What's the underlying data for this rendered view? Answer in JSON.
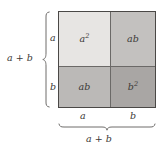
{
  "figure": {
    "quadrants": [
      {
        "name": "top-left",
        "label": "a",
        "exponent": "2",
        "fill": "#e7e5e3"
      },
      {
        "name": "top-right",
        "label": "ab",
        "exponent": "",
        "fill": "#c3c1bf"
      },
      {
        "name": "bottom-left",
        "label": "ab",
        "exponent": "",
        "fill": "#bbb9b7"
      },
      {
        "name": "bottom-right",
        "label": "b",
        "exponent": "2",
        "fill": "#a9a6a4"
      }
    ],
    "left_side": {
      "total_label": "a + b",
      "segment_top_label": "a",
      "segment_bottom_label": "b"
    },
    "bottom_side": {
      "total_label": "a + b",
      "segment_left_label": "a",
      "segment_right_label": "b"
    },
    "colors": {
      "border": "#4a4846",
      "divider": "#6b6967",
      "brace": "#6f6d6b",
      "text": "#3b3937",
      "background": "#ffffff"
    }
  }
}
